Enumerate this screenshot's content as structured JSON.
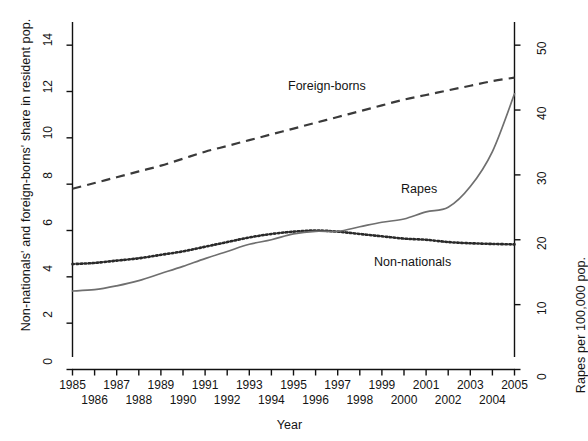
{
  "axes": {
    "x_title": "Year",
    "y_left_title": "Non-nationals' and foreign-borns' share in resident pop.",
    "y_right_title": "Rapes per 100,000 pop.",
    "y_left_ticks": [
      "0",
      "2",
      "4",
      "6",
      "8",
      "10",
      "12",
      "14"
    ],
    "y_right_ticks": [
      "0",
      "10",
      "20",
      "30",
      "40",
      "50"
    ],
    "x_ticks_odd": [
      "1985",
      "1987",
      "1989",
      "1991",
      "1993",
      "1995",
      "1997",
      "1999",
      "2001",
      "2003",
      "2005"
    ],
    "x_ticks_even": [
      "1986",
      "1988",
      "1990",
      "1992",
      "1994",
      "1996",
      "1998",
      "2000",
      "2002",
      "2004"
    ]
  },
  "annotations": {
    "foreign_borns": "Foreign-borns",
    "rapes": "Rapes",
    "non_nationals": "Non-nationals"
  },
  "chart_data": {
    "type": "line",
    "title": "",
    "xlabel": "Year",
    "ylabel": "Non-nationals' and foreign-borns' share in resident pop.",
    "ylabel_right": "Rapes per 100,000 pop.",
    "xlim": [
      1985,
      2005
    ],
    "ylim": [
      0,
      15
    ],
    "ylim_right": [
      0,
      53.57
    ],
    "grid": false,
    "legend": "inline-annotations",
    "x": [
      1985,
      1986,
      1987,
      1988,
      1989,
      1990,
      1991,
      1992,
      1993,
      1994,
      1995,
      1996,
      1997,
      1998,
      1999,
      2000,
      2001,
      2002,
      2003,
      2004,
      2005
    ],
    "series": [
      {
        "name": "Foreign-borns",
        "axis": "left",
        "units": "share in resident pop. (%)",
        "style": "dashed",
        "color": "#3a3a3a",
        "values": [
          7.8,
          8.05,
          8.3,
          8.55,
          8.8,
          9.1,
          9.4,
          9.65,
          9.9,
          10.15,
          10.4,
          10.65,
          10.9,
          11.15,
          11.4,
          11.65,
          11.85,
          12.05,
          12.25,
          12.45,
          12.6
        ]
      },
      {
        "name": "Non-nationals",
        "axis": "left",
        "units": "share in resident pop. (%)",
        "style": "dotted",
        "color": "#2a2a2a",
        "values": [
          4.55,
          4.6,
          4.7,
          4.8,
          4.95,
          5.1,
          5.3,
          5.5,
          5.7,
          5.85,
          5.95,
          6.0,
          5.95,
          5.85,
          5.75,
          5.65,
          5.6,
          5.5,
          5.45,
          5.42,
          5.4
        ]
      },
      {
        "name": "Rapes",
        "axis": "right",
        "units": "rapes per 100,000 pop.",
        "style": "solid",
        "color": "#6f6f6f",
        "values_left_scale": [
          3.4,
          3.45,
          3.6,
          3.85,
          4.15,
          4.45,
          4.8,
          5.1,
          5.4,
          5.6,
          5.85,
          5.95,
          5.95,
          6.15,
          6.35,
          6.5,
          6.8,
          7.0,
          7.9,
          9.4,
          11.9
        ],
        "values": [
          12.1,
          12.3,
          12.9,
          13.7,
          14.8,
          15.9,
          17.1,
          18.2,
          19.3,
          20.0,
          20.9,
          21.3,
          21.3,
          22.0,
          22.7,
          23.2,
          24.3,
          25.0,
          28.2,
          33.6,
          42.5
        ]
      }
    ]
  }
}
